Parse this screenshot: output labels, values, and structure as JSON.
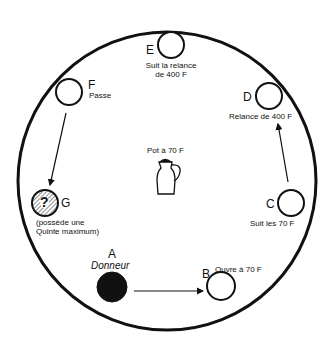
{
  "diagram": {
    "pot_label": "Pot à 70 F",
    "players": {
      "A": {
        "letter": "A",
        "label": "Donneur"
      },
      "B": {
        "letter": "B",
        "label": "Ouvre à 70 F"
      },
      "C": {
        "letter": "C",
        "label": "Suit les 70 F"
      },
      "D": {
        "letter": "D",
        "label": "Relance de 400 F"
      },
      "E": {
        "letter": "E",
        "label_line1": "Suit la relance",
        "label_line2": "de 400 F"
      },
      "F": {
        "letter": "F",
        "label": "Passe"
      },
      "G": {
        "letter": "G",
        "label_line1": "(possède une",
        "label_line2": "Quinte maximum)",
        "mark": "?"
      }
    }
  }
}
